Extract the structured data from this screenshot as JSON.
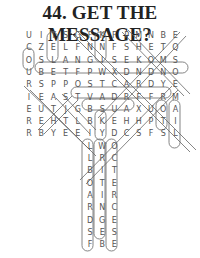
{
  "title": "44. GET THE MESSAGE?",
  "grid": {
    "rows": [
      "UITSGFKFPMNBE",
      "CZELFNNFSHETQ",
      "OSLANGISEKOMS",
      "UBETFPWXDNDNO",
      "RSPPOSTCARDYE",
      "IEASTVADRFFRM",
      "EUTJGBSUAXUOA",
      "REHTLBKEHHPTI",
      "RBYEEIYDCSFSL"
    ],
    "trunk": [
      "LWO",
      "LRC",
      "BIT",
      "OTE",
      "AIR",
      "RNC",
      "DGE",
      "SES",
      "FBE"
    ],
    "trunk_start_col": 5
  }
}
